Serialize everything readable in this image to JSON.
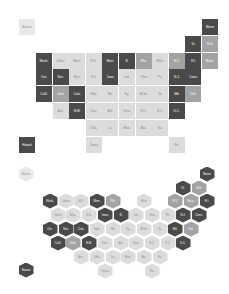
{
  "legend_colors": {
    "dark": "#4a4a4a",
    "mid": "#a3a3a3",
    "light": "#dcdcdc",
    "pale": "#e8e8e8"
  },
  "grid_map": {
    "tiles": [
      {
        "label": "Alaska",
        "col": -1,
        "row": 0,
        "shade": "pale"
      },
      {
        "label": "Maine",
        "col": 10,
        "row": 0,
        "shade": "dark"
      },
      {
        "label": "Vt.",
        "col": 9,
        "row": 1,
        "shade": "dark"
      },
      {
        "label": "N.H.",
        "col": 10,
        "row": 1,
        "shade": "mid"
      },
      {
        "label": "Wash.",
        "col": 0,
        "row": 2,
        "shade": "dark"
      },
      {
        "label": "Idaho",
        "col": 1,
        "row": 2,
        "shade": "light"
      },
      {
        "label": "Mont.",
        "col": 2,
        "row": 2,
        "shade": "light"
      },
      {
        "label": "N.D.",
        "col": 3,
        "row": 2,
        "shade": "light"
      },
      {
        "label": "Minn.",
        "col": 4,
        "row": 2,
        "shade": "dark"
      },
      {
        "label": "Ill.",
        "col": 5,
        "row": 2,
        "shade": "dark"
      },
      {
        "label": "Wis.",
        "col": 6,
        "row": 2,
        "shade": "mid"
      },
      {
        "label": "Mich.",
        "col": 7,
        "row": 2,
        "shade": "light"
      },
      {
        "label": "N.Y.",
        "col": 8,
        "row": 2,
        "shade": "mid"
      },
      {
        "label": "R.I.",
        "col": 9,
        "row": 2,
        "shade": "dark"
      },
      {
        "label": "Mass.",
        "col": 10,
        "row": 2,
        "shade": "mid"
      },
      {
        "label": "Ore.",
        "col": 0,
        "row": 3,
        "shade": "dark"
      },
      {
        "label": "Nev.",
        "col": 1,
        "row": 3,
        "shade": "dark"
      },
      {
        "label": "Wyo.",
        "col": 2,
        "row": 3,
        "shade": "light"
      },
      {
        "label": "S.D.",
        "col": 3,
        "row": 3,
        "shade": "light"
      },
      {
        "label": "Iowa",
        "col": 4,
        "row": 3,
        "shade": "dark"
      },
      {
        "label": "Ind.",
        "col": 5,
        "row": 3,
        "shade": "light"
      },
      {
        "label": "Ohio",
        "col": 6,
        "row": 3,
        "shade": "light"
      },
      {
        "label": "Pa.",
        "col": 7,
        "row": 3,
        "shade": "light"
      },
      {
        "label": "N.J.",
        "col": 8,
        "row": 3,
        "shade": "dark"
      },
      {
        "label": "Conn.",
        "col": 9,
        "row": 3,
        "shade": "dark"
      },
      {
        "label": "Calif.",
        "col": 0,
        "row": 4,
        "shade": "dark"
      },
      {
        "label": "Utah",
        "col": 1,
        "row": 4,
        "shade": "mid"
      },
      {
        "label": "Colo.",
        "col": 2,
        "row": 4,
        "shade": "dark"
      },
      {
        "label": "Neb.",
        "col": 3,
        "row": 4,
        "shade": "light"
      },
      {
        "label": "Mo.",
        "col": 4,
        "row": 4,
        "shade": "light"
      },
      {
        "label": "Ky.",
        "col": 5,
        "row": 4,
        "shade": "light"
      },
      {
        "label": "W.Va.",
        "col": 6,
        "row": 4,
        "shade": "light"
      },
      {
        "label": "Va.",
        "col": 7,
        "row": 4,
        "shade": "light"
      },
      {
        "label": "Md.",
        "col": 8,
        "row": 4,
        "shade": "dark"
      },
      {
        "label": "Del.",
        "col": 9,
        "row": 4,
        "shade": "mid"
      },
      {
        "label": "Ariz.",
        "col": 1,
        "row": 5,
        "shade": "light"
      },
      {
        "label": "N.M.",
        "col": 2,
        "row": 5,
        "shade": "dark"
      },
      {
        "label": "Kan.",
        "col": 3,
        "row": 5,
        "shade": "light"
      },
      {
        "label": "Ark.",
        "col": 4,
        "row": 5,
        "shade": "light"
      },
      {
        "label": "Tenn.",
        "col": 5,
        "row": 5,
        "shade": "light"
      },
      {
        "label": "N.C.",
        "col": 6,
        "row": 5,
        "shade": "light"
      },
      {
        "label": "S.C.",
        "col": 7,
        "row": 5,
        "shade": "light"
      },
      {
        "label": "D.C.",
        "col": 8,
        "row": 5,
        "shade": "dark"
      },
      {
        "label": "Okla.",
        "col": 3,
        "row": 6,
        "shade": "light"
      },
      {
        "label": "La.",
        "col": 4,
        "row": 6,
        "shade": "light"
      },
      {
        "label": "Miss.",
        "col": 5,
        "row": 6,
        "shade": "light"
      },
      {
        "label": "Ala.",
        "col": 6,
        "row": 6,
        "shade": "light"
      },
      {
        "label": "Ga.",
        "col": 7,
        "row": 6,
        "shade": "light"
      },
      {
        "label": "Hawaii",
        "col": -1,
        "row": 7,
        "shade": "dark"
      },
      {
        "label": "Texas",
        "col": 3,
        "row": 7,
        "shade": "light"
      },
      {
        "label": "Fla.",
        "col": 8,
        "row": 7,
        "shade": "light"
      }
    ]
  },
  "hex_map": {
    "hexes": [
      {
        "label": "Alaska",
        "x": 26,
        "y": 24,
        "shade": "pale"
      },
      {
        "label": "Maine",
        "x": 207,
        "y": 24,
        "shade": "dark"
      },
      {
        "label": "Vt.",
        "x": 183,
        "y": 38,
        "shade": "dark"
      },
      {
        "label": "N.H.",
        "x": 199,
        "y": 38,
        "shade": "mid"
      },
      {
        "label": "Wash.",
        "x": 50,
        "y": 51,
        "shade": "dark"
      },
      {
        "label": "Idaho",
        "x": 66,
        "y": 51,
        "shade": "light"
      },
      {
        "label": "N.D.",
        "x": 81,
        "y": 51,
        "shade": "light"
      },
      {
        "label": "Minn.",
        "x": 97,
        "y": 51,
        "shade": "dark"
      },
      {
        "label": "Wis.",
        "x": 113,
        "y": 51,
        "shade": "mid"
      },
      {
        "label": "Mich.",
        "x": 144,
        "y": 51,
        "shade": "light"
      },
      {
        "label": "N.Y.",
        "x": 175,
        "y": 51,
        "shade": "mid"
      },
      {
        "label": "Mass.",
        "x": 191,
        "y": 51,
        "shade": "mid"
      },
      {
        "label": "R.I.",
        "x": 207,
        "y": 51,
        "shade": "dark"
      },
      {
        "label": "Idaho",
        "x": 58,
        "y": 65,
        "shade": "light"
      },
      {
        "label": "Wyo.",
        "x": 73,
        "y": 65,
        "shade": "light"
      },
      {
        "label": "S.D.",
        "x": 89,
        "y": 65,
        "shade": "light"
      },
      {
        "label": "Iowa",
        "x": 105,
        "y": 65,
        "shade": "dark"
      },
      {
        "label": "Ill.",
        "x": 121,
        "y": 65,
        "shade": "dark"
      },
      {
        "label": "Ind.",
        "x": 136,
        "y": 65,
        "shade": "light"
      },
      {
        "label": "Ohio",
        "x": 152,
        "y": 65,
        "shade": "light"
      },
      {
        "label": "Pa.",
        "x": 168,
        "y": 65,
        "shade": "light"
      },
      {
        "label": "N.J.",
        "x": 183,
        "y": 65,
        "shade": "dark"
      },
      {
        "label": "Conn.",
        "x": 199,
        "y": 65,
        "shade": "dark"
      },
      {
        "label": "Ore.",
        "x": 50,
        "y": 79,
        "shade": "dark"
      },
      {
        "label": "Nev.",
        "x": 66,
        "y": 79,
        "shade": "dark"
      },
      {
        "label": "Colo.",
        "x": 81,
        "y": 79,
        "shade": "dark"
      },
      {
        "label": "Neb.",
        "x": 97,
        "y": 79,
        "shade": "light"
      },
      {
        "label": "Mo.",
        "x": 113,
        "y": 79,
        "shade": "light"
      },
      {
        "label": "Ky.",
        "x": 128,
        "y": 79,
        "shade": "light"
      },
      {
        "label": "W.Va.",
        "x": 144,
        "y": 79,
        "shade": "light"
      },
      {
        "label": "Va.",
        "x": 160,
        "y": 79,
        "shade": "light"
      },
      {
        "label": "Md.",
        "x": 175,
        "y": 79,
        "shade": "dark"
      },
      {
        "label": "Del.",
        "x": 191,
        "y": 79,
        "shade": "mid"
      },
      {
        "label": "Calif.",
        "x": 58,
        "y": 93,
        "shade": "dark"
      },
      {
        "label": "Utah",
        "x": 73,
        "y": 93,
        "shade": "mid"
      },
      {
        "label": "N.M.",
        "x": 89,
        "y": 93,
        "shade": "dark"
      },
      {
        "label": "Kan.",
        "x": 105,
        "y": 93,
        "shade": "light"
      },
      {
        "label": "Ark.",
        "x": 121,
        "y": 93,
        "shade": "light"
      },
      {
        "label": "Tenn.",
        "x": 136,
        "y": 93,
        "shade": "light"
      },
      {
        "label": "N.C.",
        "x": 152,
        "y": 93,
        "shade": "light"
      },
      {
        "label": "S.C.",
        "x": 168,
        "y": 93,
        "shade": "light"
      },
      {
        "label": "D.C.",
        "x": 183,
        "y": 93,
        "shade": "dark"
      },
      {
        "label": "Ariz.",
        "x": 81,
        "y": 107,
        "shade": "light"
      },
      {
        "label": "Okla.",
        "x": 97,
        "y": 107,
        "shade": "light"
      },
      {
        "label": "La.",
        "x": 113,
        "y": 107,
        "shade": "light"
      },
      {
        "label": "Miss.",
        "x": 128,
        "y": 107,
        "shade": "light"
      },
      {
        "label": "Ala.",
        "x": 144,
        "y": 107,
        "shade": "light"
      },
      {
        "label": "Ga.",
        "x": 160,
        "y": 107,
        "shade": "light"
      },
      {
        "label": "Hawaii",
        "x": 26,
        "y": 120,
        "shade": "dark"
      },
      {
        "label": "Texas",
        "x": 105,
        "y": 121,
        "shade": "light"
      },
      {
        "label": "Fla.",
        "x": 152,
        "y": 121,
        "shade": "light"
      }
    ]
  }
}
